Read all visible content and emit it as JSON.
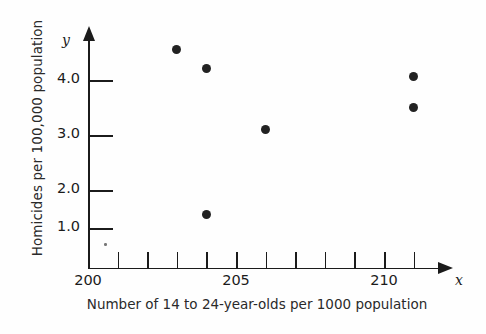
{
  "chart_data": {
    "type": "scatter",
    "title": "",
    "xlabel": "Number of 14 to 24-year-olds per 1000 population",
    "ylabel": "Homicides per 100,000 population",
    "x_axis_symbol": "x",
    "y_axis_symbol": "y",
    "xlim": [
      200,
      212
    ],
    "ylim": [
      0,
      4.6
    ],
    "grid": false,
    "legend": null,
    "x_ticks": [
      {
        "value": 200,
        "label": "200"
      },
      {
        "value": 201,
        "label": ""
      },
      {
        "value": 202,
        "label": ""
      },
      {
        "value": 203,
        "label": ""
      },
      {
        "value": 204,
        "label": ""
      },
      {
        "value": 205,
        "label": "205"
      },
      {
        "value": 206,
        "label": ""
      },
      {
        "value": 207,
        "label": ""
      },
      {
        "value": 208,
        "label": ""
      },
      {
        "value": 209,
        "label": ""
      },
      {
        "value": 210,
        "label": "210"
      },
      {
        "value": 211,
        "label": ""
      }
    ],
    "y_ticks": [
      {
        "value": 1.0,
        "label": "1.0"
      },
      {
        "value": 2.0,
        "label": "2.0"
      },
      {
        "value": 3.0,
        "label": "3.0"
      },
      {
        "value": 4.0,
        "label": "4.0"
      }
    ],
    "points": [
      {
        "x": 203.0,
        "y": 4.25
      },
      {
        "x": 204.0,
        "y": 3.9
      },
      {
        "x": 204.0,
        "y": 1.25
      },
      {
        "x": 206.0,
        "y": 2.8
      },
      {
        "x": 211.0,
        "y": 3.75
      },
      {
        "x": 211.0,
        "y": 3.2
      }
    ]
  },
  "labels": {
    "xtick_0": "200",
    "xtick_5": "205",
    "xtick_10": "210",
    "ytick_1": "1.0",
    "ytick_2": "2.0",
    "ytick_3": "3.0",
    "ytick_4": "4.0",
    "x_symbol": "x",
    "y_symbol": "y",
    "x_caption": "Number of 14 to 24-year-olds per 1000 population",
    "y_caption": "Homicides per 100,000 population"
  }
}
